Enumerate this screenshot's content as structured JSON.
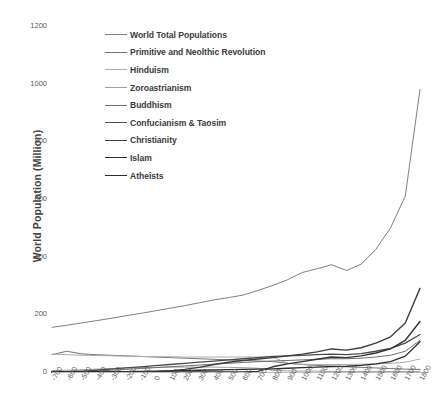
{
  "chart_data": {
    "type": "line",
    "title": "",
    "xlabel": "",
    "ylabel": "World Population (Million)",
    "xlim": [
      -700,
      1800
    ],
    "ylim": [
      0,
      1200
    ],
    "grid": false,
    "legend_position": "inside-top-left",
    "x": [
      -700,
      -600,
      -500,
      -400,
      -300,
      -200,
      -100,
      0,
      100,
      200,
      300,
      400,
      500,
      600,
      700,
      800,
      900,
      1000,
      1100,
      1200,
      1300,
      1400,
      1500,
      1600,
      1700,
      1800
    ],
    "x_tick_labels": [
      "-700",
      "-600",
      "-500",
      "-400",
      "-300",
      "-200",
      "-100",
      "0",
      "100",
      "200",
      "300",
      "400",
      "500",
      "600",
      "700",
      "800",
      "900",
      "1000",
      "1100",
      "1200",
      "1300",
      "1400",
      "1500",
      "1600",
      "1700",
      "1800"
    ],
    "y_tick_labels": [
      "0",
      "200",
      "400",
      "600",
      "800",
      "1000",
      "1200"
    ],
    "y_ticks": [
      0,
      200,
      400,
      600,
      800,
      1000,
      1200
    ],
    "series": [
      {
        "name": "World Total Populations",
        "color": "#808080",
        "width": 1.0,
        "values": [
          155,
          162,
          170,
          178,
          186,
          195,
          203,
          212,
          221,
          230,
          240,
          250,
          258,
          267,
          283,
          300,
          320,
          345,
          358,
          372,
          352,
          374,
          425,
          500,
          610,
          980
        ]
      },
      {
        "name": "Primitive and Neolthic Revolution",
        "color": "#737373",
        "width": 1.0,
        "values": [
          60,
          72,
          63,
          60,
          58,
          56,
          54,
          52,
          50,
          48,
          46,
          44,
          42,
          40,
          38,
          36,
          30,
          26,
          23,
          20,
          18,
          16,
          14,
          12,
          10,
          9
        ]
      },
      {
        "name": "Hinduism",
        "color": "#adadad",
        "width": 1.0,
        "values": [
          62,
          60,
          58,
          57,
          56,
          55,
          54,
          53,
          53,
          52,
          52,
          52,
          52,
          52,
          52,
          52,
          30,
          27,
          26,
          26,
          26,
          27,
          28,
          30,
          34,
          45
        ]
      },
      {
        "name": "Zoroastrianism",
        "color": "#9e9e9e",
        "width": 1.0,
        "values": [
          5,
          6,
          8,
          10,
          12,
          14,
          15,
          16,
          17,
          17,
          17,
          17,
          16,
          15,
          13,
          6,
          4,
          3,
          3,
          2,
          2,
          2,
          2,
          2,
          2,
          2
        ]
      },
      {
        "name": "Buddhism",
        "color": "#6e6e6e",
        "width": 1.0,
        "values": [
          0,
          0,
          1,
          3,
          6,
          9,
          12,
          15,
          18,
          21,
          24,
          27,
          30,
          33,
          36,
          38,
          40,
          42,
          44,
          46,
          46,
          48,
          52,
          58,
          72,
          110
        ]
      },
      {
        "name": "Confucianism & Taosim",
        "color": "#4a4a4a",
        "width": 1.3,
        "values": [
          0,
          1,
          3,
          6,
          10,
          14,
          18,
          22,
          26,
          30,
          34,
          38,
          42,
          46,
          50,
          54,
          56,
          58,
          60,
          62,
          60,
          64,
          72,
          82,
          100,
          130
        ]
      },
      {
        "name": "Christianity",
        "color": "#3d3d3d",
        "width": 1.4,
        "values": [
          0,
          0,
          0,
          0,
          0,
          0,
          0,
          1,
          4,
          9,
          16,
          26,
          34,
          40,
          45,
          50,
          56,
          62,
          70,
          80,
          76,
          84,
          100,
          122,
          170,
          290
        ]
      },
      {
        "name": "Islam",
        "color": "#333333",
        "width": 1.4,
        "values": [
          0,
          0,
          0,
          0,
          0,
          0,
          0,
          0,
          0,
          0,
          0,
          0,
          0,
          0,
          2,
          18,
          28,
          36,
          44,
          52,
          50,
          56,
          66,
          80,
          110,
          175
        ]
      },
      {
        "name": "Atheists",
        "color": "#2b2b2b",
        "width": 1.3,
        "values": [
          0,
          0,
          0,
          0,
          0,
          1,
          2,
          3,
          4,
          5,
          6,
          7,
          8,
          9,
          10,
          11,
          13,
          15,
          17,
          19,
          20,
          23,
          28,
          36,
          55,
          105
        ]
      }
    ]
  },
  "legend": {
    "items": [
      {
        "label": "World Total Populations",
        "color": "#808080",
        "width": 1.1
      },
      {
        "label": "Primitive and Neolthic Revolution",
        "color": "#737373",
        "width": 1.1
      },
      {
        "label": "Hinduism",
        "color": "#adadad",
        "width": 1.1
      },
      {
        "label": "Zoroastrianism",
        "color": "#9e9e9e",
        "width": 1.1
      },
      {
        "label": "Buddhism",
        "color": "#6e6e6e",
        "width": 1.2
      },
      {
        "label": "Confucianism & Taosim",
        "color": "#4a4a4a",
        "width": 1.6
      },
      {
        "label": "Christianity",
        "color": "#3d3d3d",
        "width": 1.7
      },
      {
        "label": "Islam",
        "color": "#333333",
        "width": 1.7
      },
      {
        "label": "Atheists",
        "color": "#2b2b2b",
        "width": 1.7
      }
    ]
  },
  "axes": {
    "y_title": "World Population (Million)",
    "axis_line_color": "#bfbfbf",
    "tick_text_color": "#595959"
  }
}
